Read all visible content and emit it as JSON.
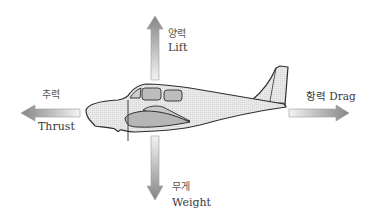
{
  "diagram": {
    "colors": {
      "arrow_dark": "#8a8a8a",
      "arrow_light": "#f2f2f2",
      "fuselage_fill": "#e6e6e6",
      "window_fill": "#bdbdbd",
      "wing_fill": "#b8b8b8",
      "outline": "#2e2e2e",
      "text": "#3a3a3a"
    },
    "forces": {
      "lift": {
        "ko": "양력",
        "en": "Lift",
        "direction": "up"
      },
      "weight": {
        "ko": "무게",
        "en": "Weight",
        "direction": "down"
      },
      "thrust": {
        "ko": "추력",
        "en": "Thrust",
        "direction": "left"
      },
      "drag": {
        "ko": "항력",
        "en": "Drag",
        "label": "항력 Drag",
        "direction": "right"
      }
    }
  }
}
